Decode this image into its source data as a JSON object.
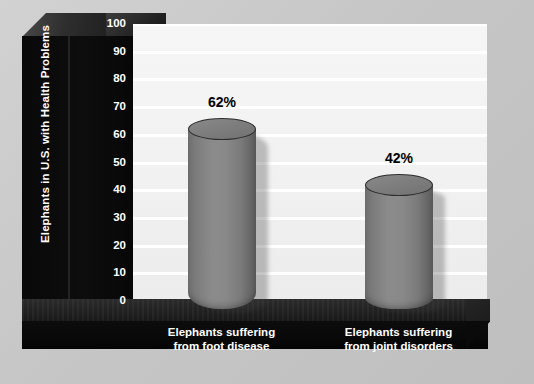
{
  "chart_data": {
    "type": "bar",
    "title": "",
    "subtitle": "",
    "xlabel": "",
    "ylabel": "Elephants in U.S. with Health Problems",
    "ylim": [
      0,
      100
    ],
    "grid": true,
    "legend": null,
    "value_suffix": "%",
    "categories": [
      "Elephants suffering from foot disease",
      "Elephants suffering from joint disorders"
    ],
    "values": [
      62,
      42
    ],
    "point_labels": [
      "62%",
      "42%"
    ],
    "y_ticks": [
      100,
      90,
      80,
      70,
      60,
      50,
      40,
      30,
      20,
      10,
      0
    ],
    "category_lines": [
      [
        "Elephants suffering",
        "from foot disease"
      ],
      [
        "Elephants suffering",
        "from joint disorders"
      ]
    ],
    "colors": {
      "background": "#c9c9c9",
      "plot_background": "#f2f2f2",
      "gridline": "#ffffff",
      "chassis": "#0a0a0a",
      "bar_fill": "#808080",
      "bar_outline": "#2c2c2c",
      "axis_text": "#ffffff",
      "value_text": "#000000"
    }
  }
}
